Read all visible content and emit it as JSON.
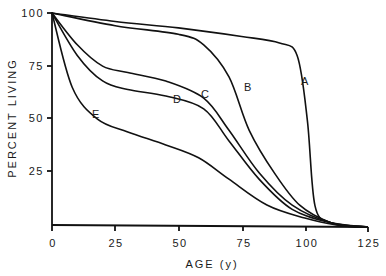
{
  "chart_data": {
    "type": "line",
    "title": "",
    "xlabel": "AGE (y)",
    "ylabel": "PERCENT LIVING",
    "xlim": [
      0,
      125
    ],
    "ylim": [
      0,
      100
    ],
    "xticks": [
      0,
      25,
      50,
      75,
      100,
      125
    ],
    "yticks": [
      25,
      50,
      75,
      100
    ],
    "grid": false,
    "legend": "inline curve labels",
    "series": [
      {
        "name": "A",
        "x": [
          0,
          25,
          50,
          75,
          90,
          97,
          101,
          104,
          110,
          120,
          125
        ],
        "values": [
          100,
          96,
          93,
          89,
          86,
          80,
          50,
          10,
          2,
          0,
          0
        ]
      },
      {
        "name": "B",
        "x": [
          0,
          25,
          50,
          60,
          70,
          78,
          88,
          98,
          110,
          120,
          125
        ],
        "values": [
          100,
          94,
          90,
          85,
          70,
          45,
          25,
          10,
          2,
          0,
          0
        ]
      },
      {
        "name": "C",
        "x": [
          0,
          10,
          20,
          30,
          45,
          60,
          70,
          82,
          95,
          110,
          125
        ],
        "values": [
          100,
          85,
          75,
          72,
          68,
          60,
          45,
          25,
          10,
          2,
          0
        ]
      },
      {
        "name": "D",
        "x": [
          0,
          10,
          20,
          30,
          45,
          60,
          70,
          82,
          95,
          110,
          125
        ],
        "values": [
          100,
          80,
          68,
          64,
          61,
          55,
          40,
          22,
          8,
          2,
          0
        ]
      },
      {
        "name": "E",
        "x": [
          0,
          8,
          18,
          30,
          45,
          58,
          70,
          85,
          100,
          112,
          125
        ],
        "values": [
          100,
          65,
          50,
          44,
          38,
          32,
          22,
          10,
          4,
          1,
          0
        ]
      }
    ]
  },
  "labels": {
    "x_axis_title": "AGE (y)",
    "y_axis_title": "PERCENT LIVING",
    "x_ticks": [
      "0",
      "25",
      "50",
      "75",
      "100",
      "125"
    ],
    "y_ticks": [
      "25",
      "50",
      "75",
      "100"
    ],
    "curves": [
      "A",
      "B",
      "C",
      "D",
      "E"
    ]
  }
}
